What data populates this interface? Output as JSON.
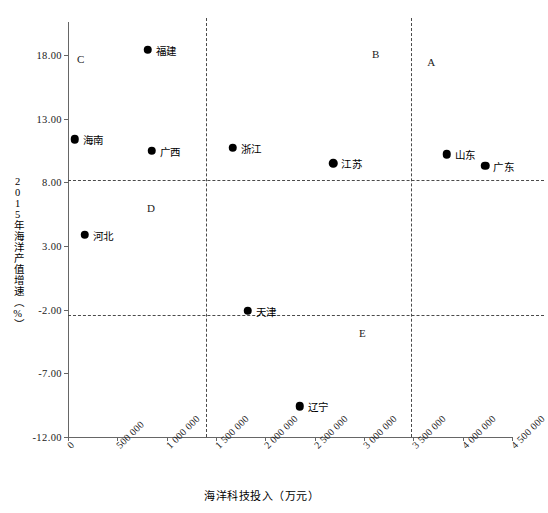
{
  "chart_data": {
    "type": "scatter",
    "title": "",
    "xlabel": "海洋科技投入（万元）",
    "ylabel": "2015年海洋产值增速（%）",
    "xlim": [
      0,
      4500000
    ],
    "ylim": [
      -12.0,
      18.0
    ],
    "grid": false,
    "legend": "none",
    "xticks": [
      "0",
      "500 000",
      "1 000 000",
      "1 500 000",
      "2 000 000",
      "2 500 000",
      "3 000 000",
      "3 500 000",
      "4 000 000",
      "4 500 000"
    ],
    "xtick_values": [
      0,
      500000,
      1000000,
      1500000,
      2000000,
      2500000,
      3000000,
      3500000,
      4000000,
      4500000
    ],
    "yticks": [
      "18.00",
      "13.00",
      "8.00",
      "3.00",
      "-2.00",
      "-7.00",
      "-12.00"
    ],
    "ytick_values": [
      18.0,
      13.0,
      8.0,
      3.0,
      -2.0,
      -7.0,
      -12.0
    ],
    "points": [
      {
        "label": "福建",
        "x": 810000,
        "y": 18.4,
        "label_side": "right"
      },
      {
        "label": "海南",
        "x": 70000,
        "y": 11.4,
        "label_side": "right"
      },
      {
        "label": "广西",
        "x": 850000,
        "y": 10.5,
        "label_side": "right"
      },
      {
        "label": "浙江",
        "x": 1670000,
        "y": 10.7,
        "label_side": "right"
      },
      {
        "label": "江苏",
        "x": 2690000,
        "y": 9.5,
        "label_side": "right"
      },
      {
        "label": "山东",
        "x": 3840000,
        "y": 10.2,
        "label_side": "right"
      },
      {
        "label": "广东",
        "x": 4230000,
        "y": 9.3,
        "label_side": "right"
      },
      {
        "label": "河北",
        "x": 170000,
        "y": 3.9,
        "label_side": "right"
      },
      {
        "label": "天津",
        "x": 1820000,
        "y": -2.1,
        "label_side": "right"
      },
      {
        "label": "辽宁",
        "x": 2350000,
        "y": -9.6,
        "label_side": "right"
      }
    ],
    "reference_lines": {
      "horizontal": [
        8.2,
        -2.4
      ],
      "vertical": [
        1400000,
        3480000
      ]
    },
    "region_labels": [
      {
        "label": "C",
        "x": 90000,
        "y": 17.6
      },
      {
        "label": "B",
        "x": 3080000,
        "y": 18.0
      },
      {
        "label": "A",
        "x": 3640000,
        "y": 17.4
      },
      {
        "label": "D",
        "x": 800000,
        "y": 5.9
      },
      {
        "label": "E",
        "x": 2950000,
        "y": -3.9
      }
    ],
    "marker_style": {
      "shape": "circle",
      "color": "#000000",
      "size": 8.5
    },
    "axis_color": "#666666",
    "reference_line_color": "#4a4a4a"
  }
}
